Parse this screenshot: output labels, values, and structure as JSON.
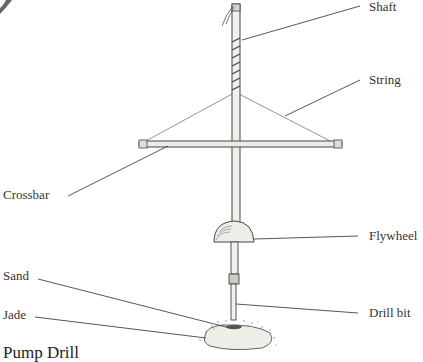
{
  "diagram": {
    "title": "Pump Drill",
    "labels": {
      "shaft": "Shaft",
      "string": "String",
      "crossbar": "Crossbar",
      "flywheel": "Flywheel",
      "sand": "Sand",
      "jade": "Jade",
      "drill_bit": "Drill bit"
    }
  }
}
